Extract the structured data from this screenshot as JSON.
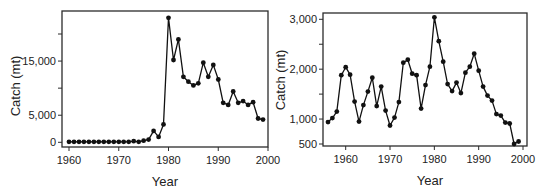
{
  "chart_data": [
    {
      "type": "line",
      "title": "",
      "xlabel": "Year",
      "ylabel": "Catch (mt)",
      "xlim": [
        1959,
        2000
      ],
      "ylim": [
        0,
        24000
      ],
      "x_ticks": [
        1960,
        1970,
        1980,
        1990,
        2000
      ],
      "x_tick_labels": [
        "1960",
        "1970",
        "1980",
        "1990",
        "2000"
      ],
      "y_ticks": [
        0,
        5000,
        10000,
        15000,
        20000
      ],
      "y_tick_labels": [
        "0",
        "5,000",
        "",
        "15,000",
        ""
      ],
      "grid": false,
      "legend": null,
      "x": [
        1960,
        1961,
        1962,
        1963,
        1964,
        1965,
        1966,
        1967,
        1968,
        1969,
        1970,
        1971,
        1972,
        1973,
        1974,
        1975,
        1976,
        1977,
        1978,
        1979,
        1980,
        1981,
        1982,
        1983,
        1984,
        1985,
        1986,
        1987,
        1988,
        1989,
        1990,
        1991,
        1992,
        1993,
        1994,
        1995,
        1996,
        1997,
        1998,
        1999
      ],
      "values": [
        100,
        100,
        100,
        100,
        100,
        100,
        100,
        100,
        100,
        100,
        100,
        100,
        100,
        200,
        100,
        300,
        500,
        2100,
        1000,
        3300,
        23000,
        15200,
        19000,
        12100,
        11200,
        10500,
        10900,
        14700,
        12100,
        14300,
        11600,
        7300,
        6900,
        9400,
        7300,
        7600,
        6900,
        7400,
        4400,
        4200
      ]
    },
    {
      "type": "line",
      "title": "",
      "xlabel": "Year",
      "ylabel": "Catch (mt)",
      "xlim": [
        1954,
        2001
      ],
      "ylim": [
        420,
        3100
      ],
      "x_ticks": [
        1960,
        1970,
        1980,
        1990,
        2000
      ],
      "x_tick_labels": [
        "1960",
        "1970",
        "1980",
        "1990",
        "2000"
      ],
      "y_ticks": [
        500,
        1000,
        1500,
        2000,
        2500,
        3000
      ],
      "y_tick_labels": [
        "500",
        "1,000",
        "",
        "2,000",
        "",
        "3,000"
      ],
      "grid": false,
      "legend": null,
      "x": [
        1956,
        1957,
        1958,
        1959,
        1960,
        1961,
        1962,
        1963,
        1964,
        1965,
        1966,
        1967,
        1968,
        1969,
        1970,
        1971,
        1972,
        1973,
        1974,
        1975,
        1976,
        1977,
        1978,
        1979,
        1980,
        1981,
        1982,
        1983,
        1984,
        1985,
        1986,
        1987,
        1988,
        1989,
        1990,
        1991,
        1992,
        1993,
        1994,
        1995,
        1996,
        1997,
        1998,
        1999
      ],
      "values": [
        940,
        1020,
        1150,
        1880,
        2040,
        1890,
        1350,
        950,
        1280,
        1550,
        1830,
        1260,
        1650,
        1170,
        870,
        1030,
        1340,
        2130,
        2190,
        1910,
        1880,
        1210,
        1680,
        2050,
        3040,
        2560,
        2150,
        1700,
        1560,
        1730,
        1520,
        1930,
        2050,
        2310,
        1970,
        1650,
        1470,
        1370,
        1100,
        1070,
        930,
        910,
        500,
        550
      ]
    }
  ],
  "layout": [
    {
      "frame": {
        "left": 62,
        "top": 11,
        "right": 268,
        "bottom": 147
      },
      "xmap": {
        "v0": 1960,
        "p0": 69,
        "v1": 2000,
        "p1": 268
      },
      "ymap": {
        "v0": 0,
        "p0": 142.3,
        "v1": 20000,
        "p1": 34
      },
      "ylabel_x": 20,
      "ylabel_y": 86,
      "xlabel_y": 186,
      "xlabel_x": 165
    },
    {
      "frame": {
        "left": 323,
        "top": 13,
        "right": 527,
        "bottom": 146
      },
      "xmap": {
        "v0": 1960,
        "p0": 345.7,
        "v1": 2000,
        "p1": 523
      },
      "ymap": {
        "v0": 3000,
        "p0": 19.3,
        "v1": 500,
        "p1": 144
      },
      "ylabel_x": 285,
      "ylabel_y": 80,
      "xlabel_y": 185,
      "xlabel_x": 430
    }
  ]
}
